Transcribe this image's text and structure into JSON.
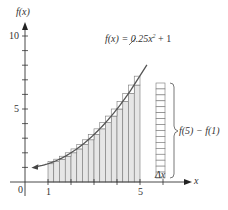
{
  "chart_data": {
    "type": "bar",
    "title": "",
    "function_label": "f(x) = 0.25x² + 1",
    "function": {
      "a": 0.25,
      "b": 1
    },
    "xlabel": "x",
    "ylabel": "f(x)",
    "xlim": [
      0,
      6.5
    ],
    "ylim": [
      0,
      11
    ],
    "x_ticks": [
      1,
      2,
      3,
      4,
      5,
      6
    ],
    "x_tick_labels": [
      "1",
      "",
      "",
      "",
      "5",
      ""
    ],
    "y_ticks": [
      1,
      2,
      3,
      4,
      5,
      6,
      7,
      8,
      9,
      10
    ],
    "y_tick_labels": [
      "",
      "",
      "",
      "",
      "5",
      "",
      "",
      "",
      "",
      "10"
    ],
    "origin_label": "0",
    "grid": false,
    "bars": {
      "start": 1,
      "end": 5,
      "dx": 0.25,
      "count": 16,
      "x": [
        1.0,
        1.25,
        1.5,
        1.75,
        2.0,
        2.25,
        2.5,
        2.75,
        3.0,
        3.25,
        3.5,
        3.75,
        4.0,
        4.25,
        4.5,
        4.75
      ],
      "heights": [
        1.25,
        1.3906,
        1.5625,
        1.7656,
        2.0,
        2.2656,
        2.5625,
        2.8906,
        3.25,
        3.6406,
        4.0625,
        4.5156,
        5.0,
        5.5156,
        6.0625,
        6.6406
      ],
      "upper_heights": [
        1.3906,
        1.5625,
        1.7656,
        2.0,
        2.2656,
        2.5625,
        2.8906,
        3.25,
        3.6406,
        4.0625,
        4.5156,
        5.0,
        5.5156,
        6.0625,
        6.0625,
        7.25
      ]
    },
    "stack_column": {
      "segments": 16,
      "label": "f(5) − f(1)",
      "width_label": "Δx"
    },
    "annotations": [
      "f(x) = 0.25x² + 1",
      "f(5) − f(1)",
      "Δx"
    ]
  },
  "labels": {
    "y_axis": "f(x)",
    "x_axis": "x",
    "origin": "0",
    "y10": "10",
    "y5": "5",
    "x1": "1",
    "x5": "5",
    "func": "f(x) = 0.25x",
    "func_exp": "2",
    "func_tail": " + 1",
    "brace_label": "f(5) − f(1)",
    "dx": "Δx"
  }
}
